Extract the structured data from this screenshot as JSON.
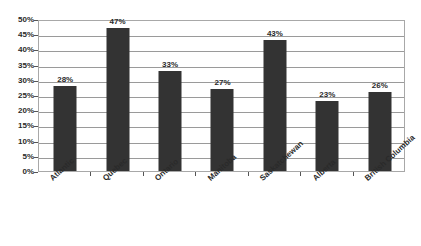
{
  "chart_data": {
    "type": "bar",
    "title": "",
    "xlabel": "",
    "ylabel": "",
    "categories": [
      "Atlantic",
      "Quebec",
      "Ontario",
      "Manitoba",
      "Saskatchewan",
      "Alberta",
      "British Columbia"
    ],
    "values": [
      28,
      47,
      33,
      27,
      43,
      23,
      26
    ],
    "data_labels": [
      "28%",
      "47%",
      "33%",
      "27%",
      "43%",
      "23%",
      "26%"
    ],
    "ylim": [
      0,
      50
    ],
    "y_tick_values": [
      0,
      5,
      10,
      15,
      20,
      25,
      30,
      35,
      40,
      45,
      50
    ],
    "y_tick_labels": [
      "0%",
      "5%",
      "10%",
      "15%",
      "20%",
      "25%",
      "30%",
      "35%",
      "40%",
      "45%",
      "50%"
    ],
    "grid": true,
    "legend": false,
    "legend_position": "none",
    "bar_color": "#333333",
    "gridline_color": "#9a9a9a",
    "plot_border_color": "#a8a8a8",
    "background_color": "#ffffff",
    "text_color": "#2a2a2a"
  }
}
